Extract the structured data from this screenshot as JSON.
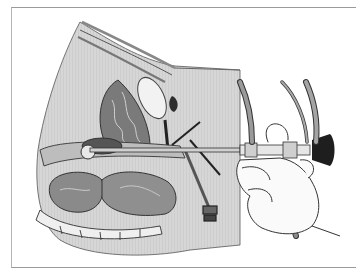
{
  "figure": {
    "caption_partial": "■ ■  ■■■ ■ ■",
    "colors": {
      "background": "#ffffff",
      "frame_line": "#9a9a9a",
      "tissue_light": "#d9d9d9",
      "tissue_mid": "#b8b8b8",
      "tissue_dark": "#6f6f6f",
      "outline": "#3a3a3a",
      "eyepiece": "#1e1e1e"
    }
  }
}
